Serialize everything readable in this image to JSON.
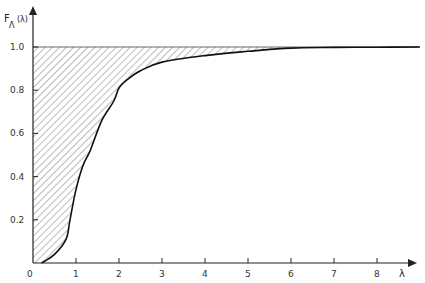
{
  "chart_data": {
    "type": "area",
    "title": "",
    "xlabel": "λ",
    "ylabel": "F_Λ(λ)",
    "ylabel_main": "F",
    "ylabel_sub": "Λ",
    "ylabel_arg": "(λ)",
    "xlim": [
      0,
      9
    ],
    "ylim": [
      0,
      1.0
    ],
    "grid": false,
    "legend": null,
    "x_ticks": [
      0,
      1,
      2,
      3,
      4,
      5,
      6,
      7,
      8
    ],
    "x_tick_labels": [
      "0",
      "1",
      "2",
      "3",
      "4",
      "5",
      "6",
      "7",
      "8"
    ],
    "y_ticks": [
      0.2,
      0.4,
      0.6,
      0.8,
      1.0
    ],
    "y_tick_labels": [
      "0.2",
      "0.4",
      "0.6",
      "0.8",
      "1.0"
    ],
    "reference_line": {
      "y": 1.0,
      "style": "thin horizontal line"
    },
    "shaded_region": "hatched area between F=1.0 and the curve F_Λ(λ)",
    "series": [
      {
        "name": "F_Λ(λ)",
        "x": [
          0.2,
          0.5,
          0.77,
          0.86,
          1.0,
          1.16,
          1.33,
          1.6,
          1.88,
          2.0,
          2.2,
          2.5,
          3.0,
          4.0,
          5.0,
          6.0,
          7.0,
          8.0,
          9.0
        ],
        "y": [
          0.0,
          0.04,
          0.11,
          0.2,
          0.34,
          0.45,
          0.52,
          0.66,
          0.75,
          0.81,
          0.85,
          0.89,
          0.93,
          0.96,
          0.98,
          0.995,
          0.998,
          0.999,
          1.0
        ]
      }
    ]
  }
}
